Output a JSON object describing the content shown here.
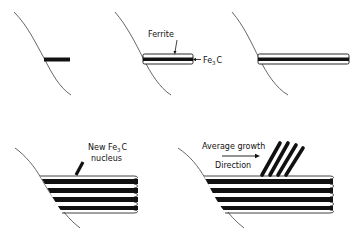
{
  "figure": {
    "panels": [
      {
        "id": "panel-1",
        "description": "Initial Fe3C nucleus at grain boundary"
      },
      {
        "id": "panel-2",
        "description": "Ferrite forms on both sides of Fe3C",
        "labels": {
          "ferrite": "Ferrite",
          "fe3c_main": "Fe",
          "fe3c_sub": "3",
          "fe3c_tail": "C"
        }
      },
      {
        "id": "panel-3",
        "description": "Ferrite/Fe3C lamella grows into grain"
      },
      {
        "id": "panel-4",
        "description": "Multiple lamellae; new Fe3C nucleus forms",
        "labels": {
          "line1_main": "New Fe",
          "line1_sub": "3",
          "line1_tail": "C",
          "line2": "nucleus"
        }
      },
      {
        "id": "panel-5",
        "description": "New colony grows at an angle",
        "labels": {
          "line1": "Average growth",
          "line2": "Direction"
        }
      }
    ],
    "colors": {
      "ink": "#111111",
      "background": "#ffffff",
      "boundary": "#555555"
    }
  }
}
